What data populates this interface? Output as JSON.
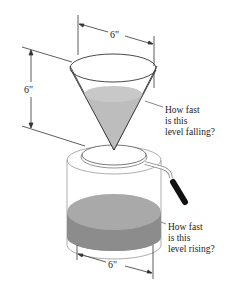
{
  "diagram": {
    "type": "related-rates-cone-pot",
    "dimensions": {
      "cone_top_diameter": "6\"",
      "cone_height": "6\"",
      "pot_diameter": "6\""
    },
    "annotations": {
      "cone_level": [
        "How fast",
        "is this",
        "level falling?"
      ],
      "pot_level": [
        "How fast",
        "is this",
        "level rising?"
      ]
    },
    "colors": {
      "cone_liquid": "#bdbdbd",
      "pot_liquid_top": "#a9a9a9",
      "pot_liquid_side": "#8c8c8c",
      "outline": "#333333",
      "handle": "#111111"
    }
  }
}
